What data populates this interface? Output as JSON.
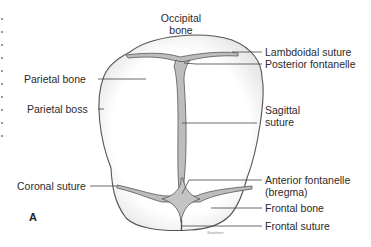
{
  "figure": {
    "panel_letter": "A",
    "signature": "Stephens",
    "colors": {
      "outline": "#555555",
      "suture_fill": "#bdbdbd",
      "fontanelle_fill": "#c4c4c4",
      "shading": "#e6e6e6",
      "leader_line": "#444444",
      "background": "#ffffff"
    }
  },
  "labels": {
    "occipital_bone": {
      "line1": "Occipital",
      "line2": "bone"
    },
    "lambdoidal_suture": "Lambdoidal suture",
    "posterior_fontanelle": "Posterior fontanelle",
    "parietal_bone": "Parietal bone",
    "parietal_boss": "Parietal boss",
    "sagittal_suture": {
      "line1": "Sagittal",
      "line2": "suture"
    },
    "coronal_suture": "Coronal suture",
    "anterior_fontanelle": {
      "line1": "Anterior fontanelle",
      "line2": "(bregma)"
    },
    "frontal_bone": "Frontal bone",
    "frontal_suture": "Frontal suture"
  }
}
